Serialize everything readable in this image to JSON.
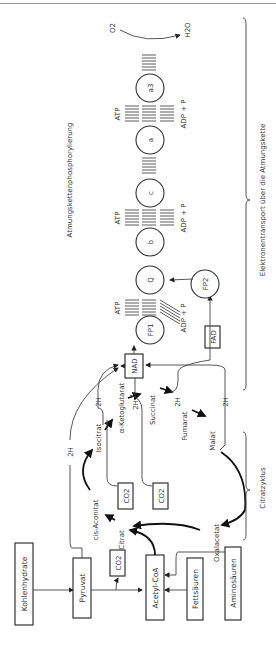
{
  "figure": {
    "orientation": "rotated-90-ccw",
    "sources": {
      "carbohydrates": "Kohlenhydrate",
      "pyruvate": "Pyruvat",
      "fatty_acids": "Fettsäuren",
      "amino_acids": "Aminosäuren",
      "acetyl_coa": "Acetyl-CoA"
    },
    "co2_label": "CO2",
    "citric_cycle": {
      "label": "Citratzyklus",
      "intermediates": [
        "Citrat",
        "cis-Aconitat",
        "Isocitrat",
        "α-Ketoglutarat",
        "Succinat",
        "Fumarat",
        "Malat",
        "Oxalacetat"
      ]
    },
    "hydrogen_label": "2H",
    "cofactors": {
      "nad": "NAD",
      "fad": "FAD"
    },
    "chain": {
      "label": "Elektronentransport über die Atmungskette",
      "phosphorylation_label": "Atmungskettenphosphorylierung",
      "carriers": [
        "FP1",
        "FP2",
        "Q",
        "b",
        "c",
        "a",
        "a3"
      ],
      "atp": "ATP",
      "adp": "ADP + P",
      "oxygen": "O2",
      "water": "H2O"
    }
  }
}
